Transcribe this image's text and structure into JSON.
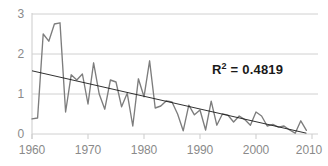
{
  "chart_data": {
    "type": "line",
    "title": "",
    "xlabel": "",
    "ylabel": "",
    "xlim": [
      1960,
      2010
    ],
    "ylim": [
      0,
      3
    ],
    "grid": true,
    "legend": false,
    "x_ticks": [
      "1960",
      "1970",
      "1980",
      "1990",
      "2000",
      "2010"
    ],
    "x_tick_values": [
      1960,
      1970,
      1980,
      1990,
      2000,
      2010
    ],
    "y_ticks": [
      "0",
      "1",
      "2",
      "3"
    ],
    "y_tick_values": [
      0,
      1,
      2,
      3
    ],
    "annotations": [
      {
        "name": "r-squared",
        "text": "R² = 0.4819",
        "value": 0.4819,
        "x": 1992,
        "y": 1.55
      }
    ],
    "x": [
      1960,
      1961,
      1962,
      1963,
      1964,
      1965,
      1966,
      1967,
      1968,
      1969,
      1970,
      1971,
      1972,
      1973,
      1974,
      1975,
      1976,
      1977,
      1978,
      1979,
      1980,
      1981,
      1982,
      1983,
      1984,
      1985,
      1986,
      1987,
      1988,
      1989,
      1990,
      1991,
      1992,
      1993,
      1994,
      1995,
      1996,
      1997,
      1998,
      1999,
      2000,
      2001,
      2002,
      2003,
      2004,
      2005,
      2006,
      2007,
      2008,
      2009
    ],
    "series": [
      {
        "name": "data",
        "color": "#7d7d7d",
        "values": [
          0.38,
          0.4,
          2.5,
          2.32,
          2.75,
          2.78,
          0.55,
          1.48,
          1.35,
          1.5,
          0.75,
          1.78,
          1.0,
          0.62,
          1.35,
          1.3,
          0.68,
          1.02,
          0.2,
          1.38,
          0.93,
          1.83,
          0.65,
          0.7,
          0.83,
          0.8,
          0.5,
          0.08,
          0.72,
          0.48,
          0.6,
          0.1,
          0.82,
          0.22,
          0.5,
          0.47,
          0.3,
          0.45,
          0.36,
          0.22,
          0.55,
          0.45,
          0.2,
          0.24,
          0.17,
          0.2,
          0.1,
          0.02,
          0.33,
          0.09
        ]
      },
      {
        "name": "linear-trendline",
        "color": "#1a1a1a",
        "type": "line",
        "x": [
          1960,
          2009
        ],
        "values": [
          1.58,
          0.02
        ]
      }
    ]
  },
  "axis": {
    "y_title": "",
    "x_title": ""
  },
  "colors": {
    "series": "#7d7d7d",
    "trendline": "#1a1a1a",
    "grid": "#d0d0d0",
    "tick_text": "#8a8a8a",
    "annotation_text": "#1a1a1a",
    "background": "#ffffff"
  }
}
